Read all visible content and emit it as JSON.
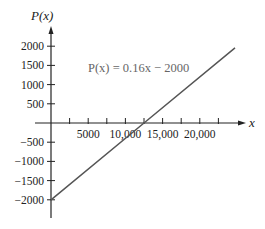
{
  "chart_data": {
    "type": "line",
    "title": "",
    "xlabel": "x",
    "ylabel": "P(x)",
    "annotation": "P(x) = 0.16x − 2000",
    "equation": {
      "slope": 0.16,
      "intercept": -2000
    },
    "xlim": [
      0,
      26000
    ],
    "ylim": [
      -2500,
      2500
    ],
    "x_ticks": [
      2500,
      5000,
      7500,
      10000,
      12500,
      15000,
      17500,
      20000,
      22500
    ],
    "x_tick_labels": [
      {
        "value": 5000,
        "label": "5000"
      },
      {
        "value": 10000,
        "label": "10,000"
      },
      {
        "value": 15000,
        "label": "15,000"
      },
      {
        "value": 20000,
        "label": "20,000"
      }
    ],
    "y_ticks": [
      2000,
      1500,
      1000,
      500,
      -500,
      -1000,
      -1500,
      -2000
    ],
    "y_tick_labels": [
      {
        "value": 2000,
        "label": "2000"
      },
      {
        "value": 1500,
        "label": "1500"
      },
      {
        "value": 1000,
        "label": "1000"
      },
      {
        "value": 500,
        "label": "500"
      },
      {
        "value": -500,
        "label": "−500"
      },
      {
        "value": -1000,
        "label": "−1000"
      },
      {
        "value": -1500,
        "label": "−1500"
      },
      {
        "value": -2000,
        "label": "−2000"
      }
    ],
    "series": [
      {
        "name": "P(x) = 0.16x − 2000",
        "x": [
          0,
          12500,
          24730
        ],
        "y": [
          -2000,
          0,
          1957
        ],
        "color": "#555555"
      }
    ],
    "grid": false,
    "legend": "none"
  },
  "labels": {
    "y_axis": "P(x)",
    "x_axis": "x",
    "equation": "P(x) = 0.16x − 2000"
  }
}
